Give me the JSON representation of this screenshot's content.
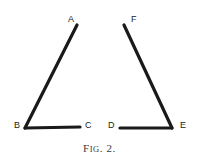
{
  "figure": {
    "caption_prefix": "F",
    "caption_small": "IG",
    "caption_suffix": ". 2.",
    "caption_full": "FIG. 2.",
    "background_color": "#ffffff",
    "ink_color": "#1a1a1a",
    "stroke_width": 3,
    "canvas": {
      "width": 199,
      "height": 165
    }
  },
  "chart_data": {
    "type": "diagram",
    "title": "FIG. 2.",
    "shapes": [
      {
        "name": "angle-abc",
        "vertex": "B",
        "rays": [
          {
            "from": "B",
            "to": "A",
            "x1": 25,
            "y1": 128,
            "x2": 77,
            "y2": 25
          },
          {
            "from": "B",
            "to": "C",
            "x1": 25,
            "y1": 128,
            "x2": 80,
            "y2": 127
          }
        ]
      },
      {
        "name": "angle-def",
        "vertex": "E",
        "rays": [
          {
            "from": "E",
            "to": "F",
            "x1": 172,
            "y1": 128,
            "x2": 124,
            "y2": 25
          },
          {
            "from": "E",
            "to": "D",
            "x1": 172,
            "y1": 128,
            "x2": 120,
            "y2": 128
          }
        ]
      }
    ],
    "labels": [
      {
        "text": "A",
        "x": 68,
        "y": 15
      },
      {
        "text": "B",
        "x": 14,
        "y": 121
      },
      {
        "text": "C",
        "x": 85,
        "y": 121
      },
      {
        "text": "D",
        "x": 108,
        "y": 121
      },
      {
        "text": "E",
        "x": 180,
        "y": 121
      },
      {
        "text": "F",
        "x": 131,
        "y": 15
      }
    ]
  }
}
